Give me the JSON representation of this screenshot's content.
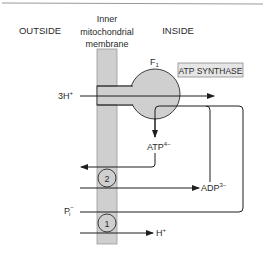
{
  "diagram": {
    "type": "mitochondrial-transport",
    "regions": {
      "outside": "OUTSIDE",
      "membrane_line1": "Inner",
      "membrane_line2": "mitochondrial",
      "membrane_line3": "membrane",
      "inside": "INSIDE"
    },
    "enzyme": {
      "f1_label": "F",
      "f1_sub": "1",
      "box_label": "ATP SYNTHASE"
    },
    "proton_in": {
      "label": "3H",
      "charge": "+"
    },
    "atp": {
      "label": "ATP",
      "charge": "4−"
    },
    "adp": {
      "label": "ADP",
      "charge": "3−"
    },
    "phosphate": {
      "label": "P",
      "sub": "i",
      "charge": "−"
    },
    "proton_out": {
      "label": "H",
      "charge": "+"
    },
    "transporters": [
      {
        "number": "2"
      },
      {
        "number": "1"
      }
    ],
    "colors": {
      "membrane_fill": "#cfcfcf",
      "membrane_stroke": "#9a9a9a",
      "line": "#1e1e1e",
      "box_fill": "#e6e6e6",
      "box_stroke": "#8a8a8a",
      "rule": "#9a9a9a"
    }
  }
}
